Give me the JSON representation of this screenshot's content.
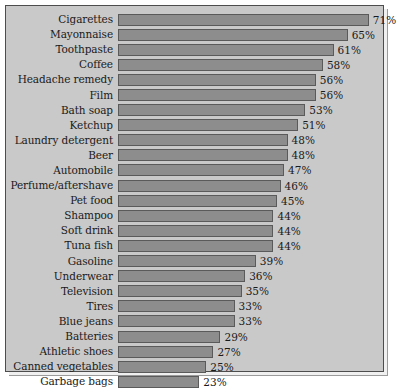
{
  "chart_data": {
    "type": "bar",
    "orientation": "horizontal",
    "title": "",
    "subtitle": "",
    "xlabel": "",
    "ylabel": "",
    "grid": false,
    "legend": null,
    "value_suffix": "%",
    "xlim": [
      0,
      75
    ],
    "categories": [
      "Cigarettes",
      "Mayonnaise",
      "Toothpaste",
      "Coffee",
      "Headache remedy",
      "Film",
      "Bath soap",
      "Ketchup",
      "Laundry detergent",
      "Beer",
      "Automobile",
      "Perfume/aftershave",
      "Pet food",
      "Shampoo",
      "Soft drink",
      "Tuna fish",
      "Gasoline",
      "Underwear",
      "Television",
      "Tires",
      "Blue jeans",
      "Batteries",
      "Athletic shoes",
      "Canned vegetables",
      "Garbage bags"
    ],
    "values": [
      71,
      65,
      61,
      58,
      56,
      56,
      53,
      51,
      48,
      48,
      47,
      46,
      45,
      44,
      44,
      44,
      39,
      36,
      35,
      33,
      33,
      29,
      27,
      25,
      23
    ],
    "value_labels": [
      "71%",
      "65%",
      "61%",
      "58%",
      "56%",
      "56%",
      "53%",
      "51%",
      "48%",
      "48%",
      "47%",
      "46%",
      "45%",
      "44%",
      "44%",
      "44%",
      "39%",
      "36%",
      "35%",
      "33%",
      "33%",
      "29%",
      "27%",
      "25%",
      "23%"
    ]
  },
  "style": {
    "background": "#c9c9c9",
    "bar_fill": "#8d8d8d",
    "bar_stroke": "#5a5a5a",
    "text": "#1a1a1a",
    "frame": "#4d4d4d"
  }
}
